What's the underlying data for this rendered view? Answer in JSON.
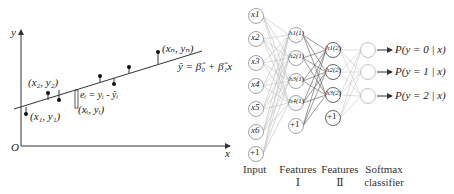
{
  "regression": {
    "axis_y_label": "y",
    "axis_x_label": "x",
    "origin_label": "O",
    "point_labels": {
      "p1": "(x₁, y₁)",
      "p2": "(x₂, y₂)",
      "pi": "(xᵢ, yᵢ)",
      "pn": "(xₙ, yₙ)"
    },
    "residual_label": "eᵢ = yᵢ - ŷᵢ",
    "fit_equation": "ŷ = β̂₀ + β̂₁x",
    "colors": {
      "line": "#333333",
      "point": "#111111"
    }
  },
  "network": {
    "input_nodes": [
      "x1",
      "x2",
      "x3",
      "x4",
      "x5",
      "x6",
      "+1"
    ],
    "features1_nodes": [
      "h1(1)",
      "h2(1)",
      "h3(1)",
      "h4(1)",
      "+1"
    ],
    "features2_nodes": [
      "h1(2)",
      "h2(2)",
      "h3(2)",
      "+1"
    ],
    "softmax_nodes": 3,
    "outputs": [
      "P(y = 0 | x)",
      "P(y = 1 | x)",
      "P(y = 2 | x)"
    ],
    "captions": {
      "input": "Input",
      "features1_line1": "Features",
      "features1_line2": "Ⅰ",
      "features2_line1": "Features",
      "features2_line2": "Ⅱ",
      "softmax_line1": "Softmax",
      "softmax_line2": "classifier"
    },
    "colors": {
      "node_stroke": "#9a9a9a",
      "edge_light": "#b8b8b8",
      "edge_dark": "#555555",
      "arrow": "#333333"
    }
  }
}
